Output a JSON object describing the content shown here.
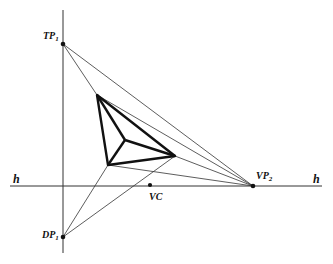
{
  "diagram": {
    "labels": {
      "tp1": {
        "main": "TP",
        "sub": "1"
      },
      "dp1": {
        "main": "DP",
        "sub": "1"
      },
      "vp2": {
        "main": "VP",
        "sub": "2"
      },
      "vc": "VC",
      "h_left": "h",
      "h_right": "h"
    },
    "points": {
      "TP1": [
        63,
        44
      ],
      "DP1": [
        63,
        237
      ],
      "VP2": [
        253,
        186
      ],
      "VC": [
        150,
        185
      ],
      "cube_top": [
        97,
        95
      ],
      "cube_inner": [
        125,
        140
      ],
      "cube_bottom_left": [
        108,
        165
      ],
      "cube_right": [
        175,
        156
      ]
    },
    "horizon_y": 186,
    "colors": {
      "line": "#222222",
      "thick": "#111111",
      "bg": "#ffffff"
    }
  }
}
